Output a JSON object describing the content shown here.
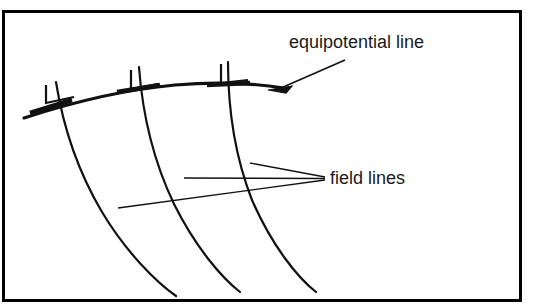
{
  "figure": {
    "type": "physics-field-diagram",
    "background_color": "#ffffff",
    "ink_color": "#111111",
    "frame": {
      "name": "diagram-border",
      "stroke_color": "#000000",
      "stroke_width": 3,
      "x": 2,
      "y": 10,
      "width": 519,
      "height": 292
    },
    "labels": [
      {
        "id": "equipotential",
        "text": "equipotential line",
        "x": 289,
        "y": 48,
        "font_size": 18,
        "anchor": "start",
        "leader": {
          "name": "equipotential-leader-line",
          "points": "280,89 296,84 345,60",
          "arrow_at": "280,89"
        }
      },
      {
        "id": "field-lines",
        "text": "field lines",
        "x": 330,
        "y": 184,
        "font_size": 18,
        "anchor": "start",
        "leaders": [
          {
            "name": "field-leader-upper",
            "points": "250,163 325,177"
          },
          {
            "name": "field-leader-middle",
            "points": "184,178 325,178"
          },
          {
            "name": "field-leader-lower",
            "points": "118,208 325,180"
          }
        ]
      }
    ],
    "equipotential_line": {
      "name": "equipotential-curve",
      "stroke_width": 3.2,
      "path": "M 24,118 C 70,103 120,90 175,85 C 222,81 258,84 284,88"
    },
    "field_lines": [
      {
        "name": "field-line-1",
        "stroke_width": 2.2,
        "path": "M 56,82 C 62,120 76,168 102,212 C 126,252 156,282 176,296"
      },
      {
        "name": "field-line-2",
        "stroke_width": 2.2,
        "path": "M 139,67 C 142,108 152,158 174,204 C 196,248 222,278 240,292"
      },
      {
        "name": "field-line-3",
        "stroke_width": 2.2,
        "path": "M 228,62 C 228,104 234,154 252,200 C 272,246 298,278 316,292"
      }
    ],
    "right_angle_markers": [
      {
        "name": "right-angle-marker-1",
        "path": "M 46,85 L 46,103 L 74,97"
      },
      {
        "name": "right-angle-marker-2",
        "path": "M 131,70 L 131,89 L 158,84"
      },
      {
        "name": "right-angle-marker-3",
        "path": "M 221,64 L 221,83 L 248,80"
      }
    ],
    "tangent_ticks": [
      {
        "name": "tangent-tick-1",
        "path": "M 30,113 L 72,100",
        "stroke_width": 4.5
      },
      {
        "name": "tangent-tick-2",
        "path": "M 117,92 L 160,85",
        "stroke_width": 4.5
      },
      {
        "name": "tangent-tick-3",
        "path": "M 207,85 L 250,83",
        "stroke_width": 4.5
      }
    ]
  }
}
